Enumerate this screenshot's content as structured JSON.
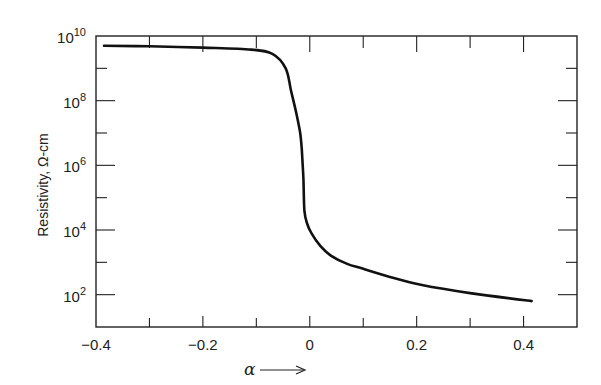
{
  "chart_data": {
    "type": "line",
    "title": "",
    "xlabel": "α →",
    "ylabel": "Resistivity, Ω-cm",
    "xlim": [
      -0.4,
      0.5
    ],
    "ylim": [
      10,
      10000000000
    ],
    "yscale": "log",
    "grid": false,
    "legend": null,
    "x_ticks": [
      -0.4,
      -0.2,
      0,
      0.2,
      0.4
    ],
    "x_tick_labels": [
      "−0.4",
      "−0.2",
      "0",
      "0.2",
      "0.4"
    ],
    "y_ticks": [
      100,
      10000,
      1000000,
      100000000,
      10000000000
    ],
    "y_tick_labels": [
      {
        "base": "10",
        "exp": "2"
      },
      {
        "base": "10",
        "exp": "4"
      },
      {
        "base": "10",
        "exp": "6"
      },
      {
        "base": "10",
        "exp": "8"
      },
      {
        "base": "10",
        "exp": "10"
      }
    ],
    "series": [
      {
        "name": "Resistivity",
        "x": [
          -0.385,
          -0.3,
          -0.2,
          -0.11,
          -0.07,
          -0.045,
          -0.035,
          -0.025,
          -0.018,
          -0.015,
          -0.012,
          -0.01,
          -0.005,
          0.003,
          0.02,
          0.04,
          0.07,
          0.1,
          0.15,
          0.21,
          0.3,
          0.415
        ],
        "log10_y": [
          9.7,
          9.68,
          9.64,
          9.58,
          9.45,
          9.0,
          8.3,
          7.6,
          7.0,
          6.5,
          5.6,
          4.6,
          4.2,
          3.9,
          3.5,
          3.2,
          2.95,
          2.8,
          2.55,
          2.3,
          2.05,
          1.8
        ]
      }
    ]
  },
  "labels": {
    "ylabel": "Resistivity, Ω-cm",
    "xlabel_symbol": "α"
  }
}
